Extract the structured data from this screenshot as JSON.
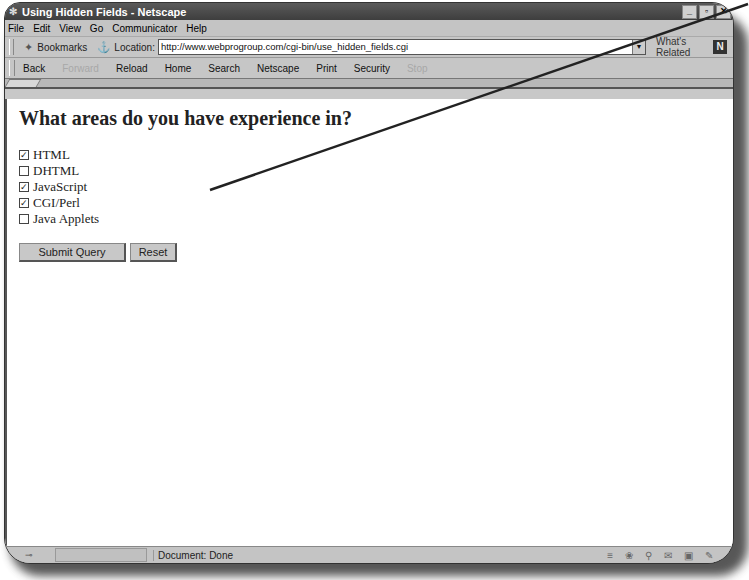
{
  "window": {
    "title": "Using Hidden Fields - Netscape",
    "controls": [
      "_",
      "▫",
      "✕"
    ]
  },
  "menubar": {
    "items": [
      {
        "label": "File"
      },
      {
        "label": "Edit"
      },
      {
        "label": "View"
      },
      {
        "label": "Go"
      },
      {
        "label": "Communicator"
      },
      {
        "label": "Help"
      }
    ]
  },
  "location_bar": {
    "bookmarks_label": "Bookmarks",
    "location_label": "Location:",
    "url": "http://www.webprogroup.com/cgi-bin/use_hidden_fields.cgi",
    "related_label": "What's Related",
    "logo": "N"
  },
  "nav_toolbar": {
    "buttons": [
      {
        "label": "Back",
        "enabled": true
      },
      {
        "label": "Forward",
        "enabled": false
      },
      {
        "label": "Reload",
        "enabled": true
      },
      {
        "label": "Home",
        "enabled": true
      },
      {
        "label": "Search",
        "enabled": true
      },
      {
        "label": "Netscape",
        "enabled": true
      },
      {
        "label": "Print",
        "enabled": true
      },
      {
        "label": "Security",
        "enabled": true
      },
      {
        "label": "Stop",
        "enabled": false
      }
    ]
  },
  "page": {
    "heading": "What areas do you have experience in?",
    "checkboxes": [
      {
        "label": "HTML",
        "checked": true,
        "mark": "✓"
      },
      {
        "label": "DHTML",
        "checked": false,
        "mark": ""
      },
      {
        "label": "JavaScript",
        "checked": true,
        "mark": "✓"
      },
      {
        "label": "CGI/Perl",
        "checked": true,
        "mark": "✓"
      },
      {
        "label": "Java Applets",
        "checked": false,
        "mark": ""
      }
    ],
    "submit_label": "Submit Query",
    "reset_label": "Reset"
  },
  "status_bar": {
    "text": "Document: Done",
    "icons": [
      "≡",
      "❀",
      "⚲",
      "✉",
      "▣",
      "✎"
    ]
  }
}
